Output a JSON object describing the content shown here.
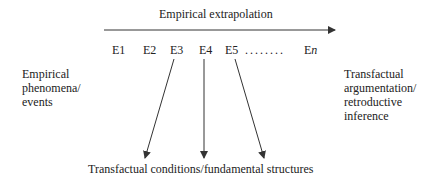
{
  "diagram": {
    "top_label": "Empirical extrapolation",
    "events": [
      "E1",
      "E2",
      "E3",
      "E4",
      "E5"
    ],
    "dots": "........",
    "last_event": {
      "prefix": "E",
      "suffix": "n"
    },
    "left_label": "Empirical\nphenomena/\nevents",
    "right_label": "Transfactual\nargumentation/\nretroductive\ninference",
    "bottom_label": "Transfactual conditions/fundamental structures",
    "colors": {
      "line": "#333333",
      "text": "#222222",
      "background": "#ffffff"
    }
  }
}
